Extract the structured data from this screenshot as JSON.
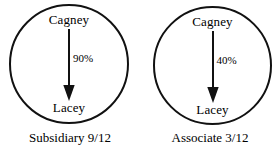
{
  "diagram": {
    "type": "relationship-circles",
    "background_color": "#ffffff",
    "stroke_color": "#111111",
    "text_color": "#000000",
    "panels": [
      {
        "id": "subsidiary",
        "source_label": "Cagney",
        "target_label": "Lacey",
        "edge_label": "90%",
        "edge_direction": "down",
        "edge_arrowhead": "filled-triangle",
        "caption": "Subsidiary 9/12"
      },
      {
        "id": "associate",
        "source_label": "Cagney",
        "target_label": "Lacey",
        "edge_label": "40%",
        "edge_direction": "down",
        "edge_arrowhead": "filled-triangle",
        "caption": "Associate 3/12"
      }
    ]
  }
}
